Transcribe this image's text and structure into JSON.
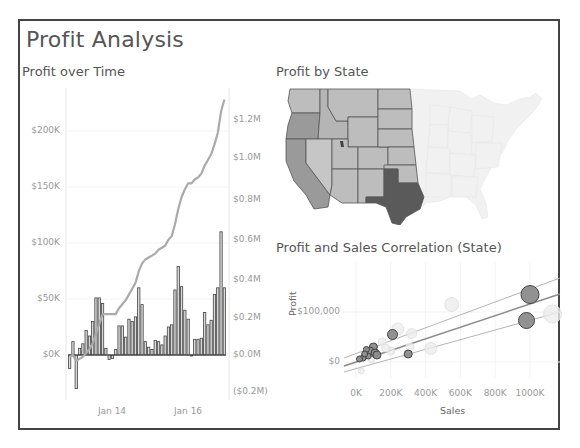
{
  "dashboard": {
    "title": "Profit Analysis",
    "border_color": "#444444"
  },
  "sheets": {
    "time": {
      "title": "Profit over Time"
    },
    "map": {
      "title": "Profit by State"
    },
    "scatter": {
      "title": "Profit and Sales Correlation (State)"
    }
  },
  "chart_data": [
    {
      "type": "bar",
      "title": "Profit over Time",
      "description": "Monthly profit bars with cumulative running-total line on secondary axis",
      "xlabel": "",
      "ylabel": "",
      "x_ticks": [
        "Jan 14",
        "Jan 16"
      ],
      "y_ticks_left": [
        "$0K",
        "$50K",
        "$100K",
        "$150K",
        "$200K"
      ],
      "y_ticks_right": [
        "($0.2M)",
        "$0.0M",
        "$0.2M",
        "$0.4M",
        "$0.6M",
        "$0.8M",
        "$1.0M",
        "$1.2M"
      ],
      "ylim_left": [
        -35000,
        230000
      ],
      "ylim_right": [
        -0.2,
        1.3
      ],
      "series": [
        {
          "name": "Monthly Profit",
          "type": "bar",
          "values": [
            -12000,
            12000,
            -30000,
            6000,
            10000,
            22000,
            17000,
            30000,
            51000,
            51000,
            46000,
            6000,
            -4000,
            -3000,
            5000,
            26000,
            26000,
            16000,
            32000,
            30000,
            34000,
            60000,
            45000,
            12000,
            7000,
            5000,
            13000,
            12000,
            9000,
            17000,
            25000,
            27000,
            58000,
            79000,
            61000,
            40000,
            32000,
            0,
            14000,
            14000,
            15000,
            38000,
            27000,
            31000,
            54000,
            60000,
            110000,
            60000
          ]
        },
        {
          "name": "Running Total Profit",
          "type": "line",
          "values_millions": [
            -0.01,
            0.0,
            -0.03,
            -0.02,
            -0.01,
            0.01,
            0.03,
            0.06,
            0.11,
            0.16,
            0.21,
            0.21,
            0.21,
            0.21,
            0.21,
            0.24,
            0.26,
            0.28,
            0.31,
            0.34,
            0.37,
            0.43,
            0.47,
            0.49,
            0.5,
            0.51,
            0.52,
            0.54,
            0.55,
            0.56,
            0.59,
            0.61,
            0.67,
            0.75,
            0.81,
            0.85,
            0.88,
            0.88,
            0.9,
            0.91,
            0.93,
            0.97,
            1.0,
            1.03,
            1.08,
            1.14,
            1.25,
            1.31
          ]
        }
      ],
      "colors": {
        "bars_fill": "#d9d9d9",
        "bars_stroke": "#444444",
        "line": "#aaaaaa"
      }
    },
    {
      "type": "map",
      "title": "Profit by State",
      "description": "Filled choropleth of western US states; eastern states faded",
      "highlighted_region": "Western states",
      "darkest": "Texas",
      "colors": {
        "high": "#555555",
        "mid": "#999999",
        "low": "#bdbdbd",
        "faded": "#f0f0f0"
      }
    },
    {
      "type": "scatter",
      "title": "Profit and Sales Correlation (State)",
      "xlabel": "Sales",
      "ylabel": "Profit",
      "x_ticks": [
        "0K",
        "200K",
        "400K",
        "600K",
        "800K",
        "1000K"
      ],
      "y_ticks": [
        "$0",
        "$100,000"
      ],
      "xlim": [
        -50000,
        1200000
      ],
      "ylim": [
        -30000,
        160000
      ],
      "trend_lines": 3,
      "points": [
        {
          "sales": 1000000,
          "profit": 135000,
          "size": 9,
          "highlight": true
        },
        {
          "sales": 980000,
          "profit": 83000,
          "size": 8,
          "highlight": true
        },
        {
          "sales": 1130000,
          "profit": 96000,
          "size": 9,
          "highlight": false
        },
        {
          "sales": 550000,
          "profit": 115000,
          "size": 7,
          "highlight": false
        },
        {
          "sales": 210000,
          "profit": 55000,
          "size": 5,
          "highlight": true
        },
        {
          "sales": 240000,
          "profit": 66000,
          "size": 6,
          "highlight": false
        },
        {
          "sales": 320000,
          "profit": 57000,
          "size": 5,
          "highlight": false
        },
        {
          "sales": 300000,
          "profit": 16000,
          "size": 4,
          "highlight": true
        },
        {
          "sales": 430000,
          "profit": 27000,
          "size": 6,
          "highlight": false
        },
        {
          "sales": 150000,
          "profit": 40000,
          "size": 4,
          "highlight": false
        },
        {
          "sales": 100000,
          "profit": 30000,
          "size": 4,
          "highlight": true
        },
        {
          "sales": 80000,
          "profit": 22000,
          "size": 4,
          "highlight": true
        },
        {
          "sales": 60000,
          "profit": 25000,
          "size": 3,
          "highlight": true
        },
        {
          "sales": 110000,
          "profit": 18000,
          "size": 4,
          "highlight": true
        },
        {
          "sales": 120000,
          "profit": 14000,
          "size": 4,
          "highlight": true
        },
        {
          "sales": 70000,
          "profit": 12000,
          "size": 3,
          "highlight": true
        },
        {
          "sales": 40000,
          "profit": 8000,
          "size": 3,
          "highlight": true
        },
        {
          "sales": 20000,
          "profit": 6000,
          "size": 3,
          "highlight": true
        },
        {
          "sales": 50000,
          "profit": 16000,
          "size": 3,
          "highlight": true
        },
        {
          "sales": 90000,
          "profit": 4000,
          "size": 3,
          "highlight": false
        },
        {
          "sales": 30000,
          "profit": -18000,
          "size": 3,
          "highlight": false
        },
        {
          "sales": 200000,
          "profit": 22000,
          "size": 4,
          "highlight": false
        },
        {
          "sales": 310000,
          "profit": 30000,
          "size": 4,
          "highlight": false
        },
        {
          "sales": 170000,
          "profit": 28000,
          "size": 4,
          "highlight": false
        }
      ],
      "colors": {
        "highlight_fill": "#8c8c8c",
        "highlight_stroke": "#444444",
        "faded_fill": "#ececec",
        "faded_stroke": "#dddddd",
        "trend": "#999999"
      }
    }
  ]
}
